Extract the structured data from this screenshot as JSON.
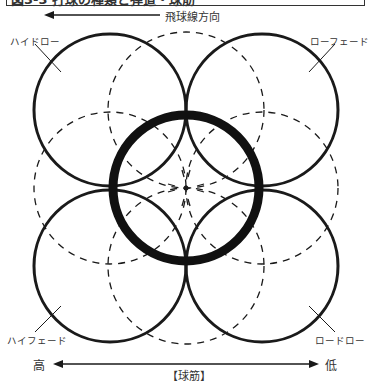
{
  "caption": {
    "text": "図3-3 打球の種類と弾道・球筋",
    "partially_visible": true
  },
  "flight_direction": {
    "label": "飛球線方向"
  },
  "corner_labels": {
    "top_left": "ハイドロー",
    "top_right": "ローフェード",
    "bottom_left": "ハイフェード",
    "bottom_right": "ロードロー"
  },
  "trajectory_axis": {
    "left": "高",
    "right": "低",
    "title": "【球筋】"
  },
  "colors": {
    "line": "#1a1a1a",
    "text": "#333333",
    "background": "#ffffff"
  }
}
